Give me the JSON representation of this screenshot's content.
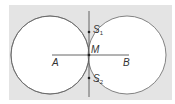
{
  "diagram": {
    "type": "geometric-construction",
    "colors": {
      "background_panel": "#e4e4e4",
      "circle_fill": "#ffffff",
      "stroke": "#555555",
      "text": "#333333"
    },
    "points": {
      "A": {
        "label": "A",
        "x": 55,
        "y": 64
      },
      "B": {
        "label": "B",
        "x": 122,
        "y": 64
      },
      "M": {
        "label": "M",
        "x": 89,
        "y": 55
      },
      "S1": {
        "label": "S",
        "sub": "1",
        "x": 89,
        "y": 32
      },
      "S2": {
        "label": "S",
        "sub": "2",
        "x": 89,
        "y": 78
      }
    },
    "circles": [
      {
        "name": "circle-left",
        "cx": 50,
        "cy": 55,
        "r": 39
      },
      {
        "name": "circle-right",
        "cx": 127,
        "cy": 55,
        "r": 39
      }
    ],
    "segments": [
      {
        "name": "segment-AB",
        "x1": 52,
        "y1": 55,
        "x2": 129,
        "y2": 55
      },
      {
        "name": "perpendicular-bisector",
        "x1": 89,
        "y1": 11,
        "x2": 89,
        "y2": 97
      }
    ]
  }
}
